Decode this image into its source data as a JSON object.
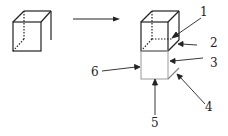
{
  "diagram": {
    "type": "cube-unfolding-schematic",
    "arrow_direction": "left-to-right",
    "labels": [
      {
        "id": "1",
        "text": "1"
      },
      {
        "id": "2",
        "text": "2"
      },
      {
        "id": "3",
        "text": "3"
      },
      {
        "id": "4",
        "text": "4"
      },
      {
        "id": "5",
        "text": "5"
      },
      {
        "id": "6",
        "text": "6"
      }
    ],
    "colors": {
      "line": "#222222",
      "hidden_edge": "#444444",
      "lower_box": "#aaaaaa"
    }
  }
}
